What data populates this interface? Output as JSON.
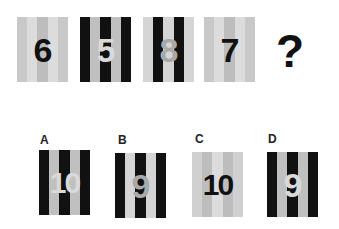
{
  "puzzle": {
    "question_mark": "?",
    "sequence": [
      {
        "value": "6",
        "stripes": [
          "#c8c8c8",
          "#dcdcdc",
          "#bdbdbd",
          "#dcdcdc",
          "#c8c8c8"
        ],
        "digit_color": "#111111"
      },
      {
        "value": "5",
        "stripes": [
          "#111111",
          "#c0c0c0",
          "#111111",
          "#c0c0c0",
          "#111111"
        ],
        "digit_color": "#d9d9d9"
      },
      {
        "value": "8",
        "stripes": [
          "#d5d5d5",
          "#111111",
          "#d5d5d5",
          "#111111",
          "#d5d5d5"
        ],
        "digit_color": "#a9a9a9"
      },
      {
        "value": "7",
        "stripes": [
          "#c8c8c8",
          "#dcdcdc",
          "#bdbdbd",
          "#dcdcdc",
          "#c8c8c8"
        ],
        "digit_color": "#111111"
      }
    ],
    "options": [
      {
        "label": "A",
        "value": "10",
        "stripes": [
          "#111111",
          "#c0c0c0",
          "#111111",
          "#c0c0c0",
          "#111111"
        ],
        "digit_color": "#d9d9d9"
      },
      {
        "label": "B",
        "value": "9",
        "stripes": [
          "#111111",
          "#d5d5d5",
          "#111111",
          "#d5d5d5",
          "#111111"
        ],
        "digit_color": "#a9a9a9"
      },
      {
        "label": "C",
        "value": "10",
        "stripes": [
          "#d0d0d0",
          "#bdbdbd",
          "#dcdcdc",
          "#bdbdbd",
          "#d0d0d0"
        ],
        "digit_color": "#111111"
      },
      {
        "label": "D",
        "value": "9",
        "stripes": [
          "#111111",
          "#c0c0c0",
          "#111111",
          "#c0c0c0",
          "#111111"
        ],
        "digit_color": "#d9d9d9"
      }
    ]
  }
}
